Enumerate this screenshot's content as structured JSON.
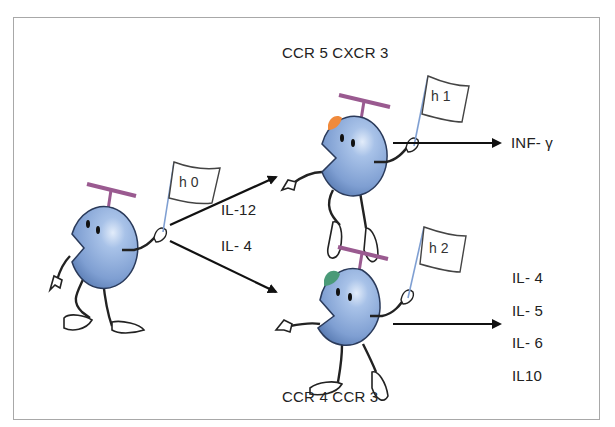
{
  "diagram": {
    "type": "cell differentiation",
    "cells": [
      {
        "id": "h0",
        "flag": "h 0",
        "cap_color": null
      },
      {
        "id": "h1",
        "flag": "h 1",
        "cap_color": "#f08a3c",
        "receptors": "CCR 5  CXCR 3"
      },
      {
        "id": "h2",
        "flag": "h 2",
        "cap_color": "#4a9a78",
        "receptors": "CCR 4   CCR 3"
      }
    ],
    "pathways": [
      {
        "from": "h0",
        "to": "h1",
        "signal": "IL-12"
      },
      {
        "from": "h0",
        "to": "h2",
        "signal": "IL- 4"
      }
    ],
    "outputs": {
      "h1": [
        "INF- γ"
      ],
      "h2": [
        "IL- 4",
        "IL- 5",
        "IL- 6",
        "IL10"
      ]
    }
  },
  "colors": {
    "cell_body": "#8fb0de",
    "cell_outline": "#2a3a5a",
    "propeller": "#9a5a90",
    "border": "#a8a8a8"
  }
}
